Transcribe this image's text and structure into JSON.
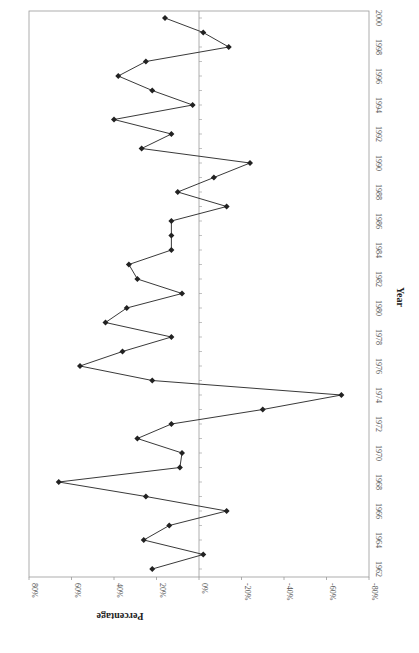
{
  "chart_data": {
    "type": "line",
    "orientation": "rotated-90-clockwise",
    "title": "",
    "xlabel": "Year",
    "ylabel": "Percentage",
    "x": [
      1962,
      1963,
      1964,
      1965,
      1966,
      1967,
      1968,
      1969,
      1970,
      1971,
      1972,
      1973,
      1974,
      1975,
      1976,
      1977,
      1978,
      1979,
      1980,
      1981,
      1982,
      1983,
      1984,
      1985,
      1986,
      1987,
      1988,
      1989,
      1990,
      1991,
      1992,
      1993,
      1994,
      1995,
      1996,
      1997,
      1998,
      1999,
      2000
    ],
    "series": [
      {
        "name": "Percentage",
        "marker": "diamond",
        "color": "#222222",
        "values": [
          22,
          -2,
          26,
          14,
          -13,
          25,
          66,
          9,
          8,
          29,
          13,
          -30,
          -67,
          22,
          56,
          36,
          13,
          44,
          34,
          8,
          29,
          33,
          13,
          13,
          13,
          -13,
          10,
          -7,
          -24,
          27,
          13,
          40,
          3,
          22,
          38,
          25,
          -14,
          -2,
          16
        ]
      }
    ],
    "x_ticks": [
      "1962",
      "1964",
      "1966",
      "1968",
      "1970",
      "1972",
      "1974",
      "1976",
      "1978",
      "1980",
      "1982",
      "1984",
      "1986",
      "1988",
      "1990",
      "1992",
      "1994",
      "1996",
      "1998",
      "2000"
    ],
    "y_ticks": [
      "80%",
      "60%",
      "40%",
      "20%",
      "0%",
      "-20%",
      "-40%",
      "-60%",
      "-80%"
    ],
    "xlim": [
      1962,
      2000
    ],
    "ylim": [
      -80,
      80
    ],
    "grid": false,
    "legend": null,
    "zero_line": true
  }
}
